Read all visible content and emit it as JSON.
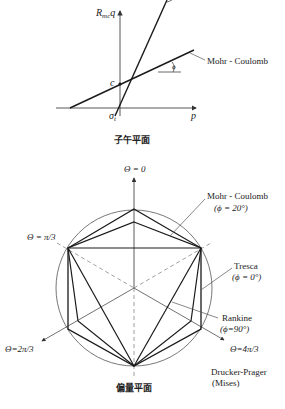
{
  "meridian_plane": {
    "caption": "子午平面",
    "y_axis_label": "R",
    "y_axis_sub": "mc",
    "y_axis_var": "q",
    "x_axis_label": "p",
    "cohesion_label": "c",
    "tension_label": "σ",
    "tension_sub": "t",
    "angle_label": "ϕ",
    "line_label": "Mohr - Coulomb"
  },
  "deviatoric_plane": {
    "caption": "偏量平面",
    "axes": {
      "theta0": "Θ = 0",
      "theta_pi3": "Θ = π/3",
      "theta_2pi3": "Θ=2π/3",
      "theta_4pi3": "Θ=4π/3"
    },
    "criteria": [
      {
        "name": "Mohr - Coulomb",
        "param": "(ϕ = 20°)"
      },
      {
        "name": "Tresca",
        "param": "(ϕ = 0°)"
      },
      {
        "name": "Rankine",
        "param": "(ϕ=90°)"
      },
      {
        "name": "Drucker-Prager",
        "param": "(Mises)"
      }
    ]
  },
  "colors": {
    "line": "#1a1a1a",
    "thin": "#555555",
    "dashed": "#777777"
  }
}
